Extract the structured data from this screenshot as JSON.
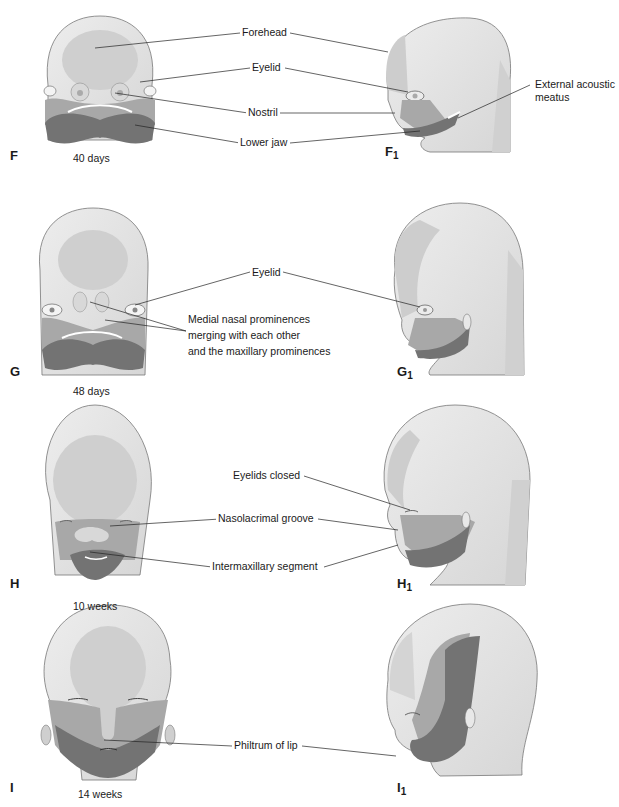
{
  "figure": {
    "rows": [
      {
        "id": "F",
        "panel_front": "F",
        "panel_side": "F",
        "panel_side_sub": "1",
        "stage": "40 days",
        "labels": [
          "Forehead",
          "Eyelid",
          "Nostril",
          "Lower jaw"
        ],
        "side_label": [
          "External acoustic",
          "meatus"
        ]
      },
      {
        "id": "G",
        "panel_front": "G",
        "panel_side": "G",
        "panel_side_sub": "1",
        "stage": "48 days",
        "labels": [
          "Eyelid"
        ],
        "note": [
          "Medial nasal prominences",
          "merging with each other",
          "and the maxillary prominences"
        ]
      },
      {
        "id": "H",
        "panel_front": "H",
        "panel_side": "H",
        "panel_side_sub": "1",
        "stage": "10 weeks",
        "labels": [
          "Eyelids closed",
          "Nasolacrimal groove",
          "Intermaxillary segment"
        ]
      },
      {
        "id": "I",
        "panel_front": "I",
        "panel_side": "I",
        "panel_side_sub": "1",
        "stage": "14 weeks",
        "labels": [
          "Philtrum of lip"
        ]
      }
    ],
    "colors": {
      "skin_light": "#e4e4e4",
      "skin_mid": "#c8c8c8",
      "maxillary": "#9e9e9e",
      "mandible": "#707070",
      "outline": "#555555",
      "leader": "#222222"
    }
  }
}
